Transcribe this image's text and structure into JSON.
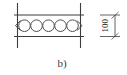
{
  "figure": {
    "caption": "b)",
    "dimension_label": "100",
    "dimension_unit_implied": "mm",
    "line_color": "#3c3c3c",
    "fill_color": "#ffffff",
    "background_color": "#ffffff",
    "void_count": 5,
    "voids": [
      {
        "index": 1,
        "cx": 24.5,
        "cy": 25.5,
        "r": 5.8
      },
      {
        "index": 2,
        "cx": 36.5,
        "cy": 25.5,
        "r": 5.8
      },
      {
        "index": 3,
        "cx": 48.5,
        "cy": 25.5,
        "r": 5.8
      },
      {
        "index": 4,
        "cx": 60.5,
        "cy": 25.5,
        "r": 5.8
      },
      {
        "index": 5,
        "cx": 72.5,
        "cy": 25.5,
        "r": 5.8
      }
    ],
    "slab": {
      "top_line_y": 15,
      "bottom_line_y": 36,
      "left_x": 17,
      "right_x": 80
    },
    "support_lines": [
      {
        "name": "left-support-line",
        "x": 17,
        "y_top": 3,
        "y_bottom": 48
      },
      {
        "name": "right-support-line",
        "x": 80,
        "y_top": 3,
        "y_bottom": 48
      }
    ],
    "break_marks": [
      {
        "name": "left-break-mark",
        "x": 17,
        "y": 25.5
      },
      {
        "name": "right-break-mark",
        "x": 80,
        "y": 25.5
      }
    ],
    "dimension": {
      "line_x": 114,
      "y_top": 15,
      "y_bottom": 36,
      "extension_top_y": 15,
      "extension_bottom_y": 36,
      "label_x": 106,
      "label_y": 25.5,
      "label_rotation_deg": -90
    }
  }
}
